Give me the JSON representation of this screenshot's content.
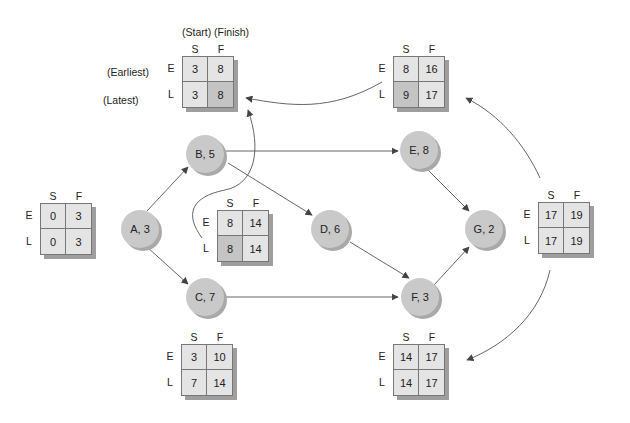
{
  "legend": {
    "start_finish": "(Start) (Finish)",
    "earliest": "(Earliest)",
    "latest": "(Latest)"
  },
  "column_labels": {
    "start": "S",
    "finish": "F"
  },
  "row_labels": {
    "earliest": "E",
    "latest": "L"
  },
  "nodes": [
    {
      "id": "A",
      "label": "A, 3",
      "duration": 3
    },
    {
      "id": "B",
      "label": "B, 5",
      "duration": 5
    },
    {
      "id": "C",
      "label": "C, 7",
      "duration": 7
    },
    {
      "id": "D",
      "label": "D, 6",
      "duration": 6
    },
    {
      "id": "E",
      "label": "E, 8",
      "duration": 8
    },
    {
      "id": "F",
      "label": "F, 3",
      "duration": 3
    },
    {
      "id": "G",
      "label": "G, 2",
      "duration": 2
    }
  ],
  "boxes": {
    "A": {
      "es": "0",
      "ef": "3",
      "ls": "0",
      "lf": "3"
    },
    "B": {
      "es": "3",
      "ef": "8",
      "ls": "3",
      "lf": "8"
    },
    "C": {
      "es": "3",
      "ef": "10",
      "ls": "7",
      "lf": "14"
    },
    "D": {
      "es": "8",
      "ef": "14",
      "ls": "8",
      "lf": "14"
    },
    "E": {
      "es": "8",
      "ef": "16",
      "ls": "9",
      "lf": "17"
    },
    "F": {
      "es": "14",
      "ef": "17",
      "ls": "14",
      "lf": "17"
    },
    "G": {
      "es": "17",
      "ef": "19",
      "ls": "17",
      "lf": "19"
    }
  },
  "edges": [
    {
      "from": "A",
      "to": "B"
    },
    {
      "from": "A",
      "to": "C"
    },
    {
      "from": "B",
      "to": "E"
    },
    {
      "from": "B",
      "to": "D"
    },
    {
      "from": "C",
      "to": "F"
    },
    {
      "from": "D",
      "to": "F"
    },
    {
      "from": "E",
      "to": "G"
    },
    {
      "from": "F",
      "to": "G"
    }
  ],
  "colors": {
    "node_fill": "#c9c9c9",
    "cell_light": "#e4e4e4",
    "cell_dark": "#c4c4c4",
    "line": "#555555"
  }
}
